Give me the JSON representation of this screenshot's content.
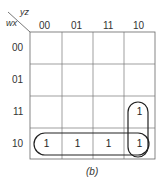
{
  "kmap": {
    "row_var": "wx",
    "col_var": "yz",
    "col_headers": [
      "00",
      "01",
      "11",
      "10"
    ],
    "row_headers": [
      "00",
      "01",
      "11",
      "10"
    ],
    "cells": [
      [
        "",
        "",
        "",
        ""
      ],
      [
        "",
        "",
        "",
        ""
      ],
      [
        "",
        "",
        "",
        "1"
      ],
      [
        "1",
        "1",
        "1",
        "1"
      ]
    ],
    "groups": [
      {
        "name": "row-10-group",
        "cells": "row 10, columns 00-10"
      },
      {
        "name": "col-10-group",
        "cells": "column 10, rows 11-10"
      }
    ],
    "caption": "(b)"
  }
}
